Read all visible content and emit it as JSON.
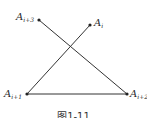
{
  "diagram": {
    "points": [
      {
        "id": "Ai3",
        "label_base": "A",
        "label_sub": "i+3",
        "x": 39,
        "y": 20
      },
      {
        "id": "Ai",
        "label_base": "A",
        "label_sub": "i",
        "x": 90,
        "y": 25
      },
      {
        "id": "Ai1",
        "label_base": "A",
        "label_sub": "i+1",
        "x": 27,
        "y": 94
      },
      {
        "id": "Ai2",
        "label_base": "A",
        "label_sub": "i+2",
        "x": 127,
        "y": 94
      }
    ],
    "segments": [
      {
        "from": "Ai3",
        "to": "Ai2"
      },
      {
        "from": "Ai",
        "to": "Ai1"
      },
      {
        "from": "Ai1",
        "to": "Ai2"
      }
    ],
    "line_color": "#333333",
    "caption": "图1-11"
  }
}
